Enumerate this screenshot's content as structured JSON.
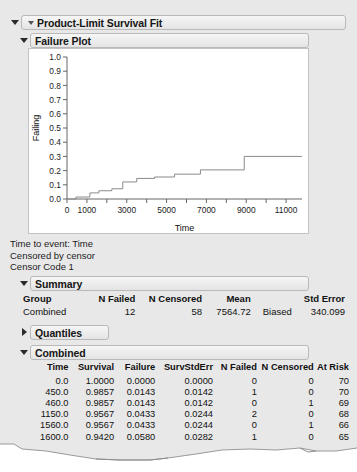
{
  "panel": {
    "title": "Product-Limit Survival Fit",
    "plot_section_title": "Failure Plot",
    "summary_section_title": "Summary",
    "quantiles_section_title": "Quantiles",
    "combined_section_title": "Combined"
  },
  "captions": {
    "line1": "Time to event: Time",
    "line2": "Censored by censor",
    "line3": "Censor Code 1"
  },
  "summary": {
    "headers": [
      "Group",
      "N Failed",
      "N Censored",
      "Mean",
      "",
      "Std Error"
    ],
    "rows": [
      {
        "group": "Combined",
        "n_failed": "12",
        "n_censored": "58",
        "mean": "7564.72",
        "bias_note": "Biased",
        "std_error": "340.099"
      }
    ]
  },
  "combined": {
    "headers": [
      "Time",
      "Survival",
      "Failure",
      "SurvStdErr",
      "N Failed",
      "N Censored",
      "At Risk"
    ],
    "rows": [
      {
        "time": "0.0",
        "survival": "1.0000",
        "failure": "0.0000",
        "survstderr": "0.0000",
        "n_failed": "0",
        "n_censored": "0",
        "at_risk": "70"
      },
      {
        "time": "450.0",
        "survival": "0.9857",
        "failure": "0.0143",
        "survstderr": "0.0142",
        "n_failed": "1",
        "n_censored": "0",
        "at_risk": "70"
      },
      {
        "time": "460.0",
        "survival": "0.9857",
        "failure": "0.0143",
        "survstderr": "0.0142",
        "n_failed": "0",
        "n_censored": "1",
        "at_risk": "69"
      },
      {
        "time": "1150.0",
        "survival": "0.9567",
        "failure": "0.0433",
        "survstderr": "0.0244",
        "n_failed": "2",
        "n_censored": "0",
        "at_risk": "68"
      },
      {
        "time": "1560.0",
        "survival": "0.9567",
        "failure": "0.0433",
        "survstderr": "0.0244",
        "n_failed": "0",
        "n_censored": "1",
        "at_risk": "66"
      },
      {
        "time": "1600.0",
        "survival": "0.9420",
        "failure": "0.0580",
        "survstderr": "0.0282",
        "n_failed": "1",
        "n_censored": "0",
        "at_risk": "65"
      }
    ]
  },
  "chart_data": {
    "type": "line",
    "title": "Failure Plot",
    "xlabel": "Time",
    "ylabel": "Failing",
    "xlim": [
      0,
      11800
    ],
    "ylim": [
      0.0,
      1.0
    ],
    "grid": false,
    "legend": "none",
    "xticks": [
      0,
      1000,
      2000,
      3000,
      4000,
      5000,
      6000,
      7000,
      8000,
      9000,
      10000,
      11000
    ],
    "xticklabels": [
      "0",
      "1000",
      "",
      "3000",
      "",
      "5000",
      "",
      "7000",
      "",
      "9000",
      "",
      "11000"
    ],
    "yticks": [
      0.0,
      0.1,
      0.2,
      0.3,
      0.4,
      0.5,
      0.6,
      0.7,
      0.8,
      0.9,
      1.0
    ],
    "yticklabels": [
      "0.0",
      "0.1",
      "0.2",
      "0.3",
      "0.4",
      "0.5",
      "0.6",
      "0.7",
      "0.8",
      "0.9",
      "1.0"
    ],
    "series": [
      {
        "name": "Failure (1 - Survival)",
        "style": "step-post",
        "color": "#8a8a8a",
        "x": [
          0,
          450,
          1150,
          1600,
          2250,
          2800,
          3500,
          4400,
          5400,
          6700,
          8900,
          11800
        ],
        "y": [
          0.0,
          0.014,
          0.043,
          0.058,
          0.072,
          0.12,
          0.145,
          0.155,
          0.175,
          0.205,
          0.3,
          0.3
        ]
      }
    ]
  }
}
